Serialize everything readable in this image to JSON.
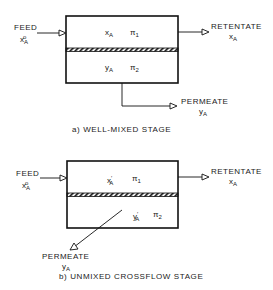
{
  "diagram_a": {
    "feed_label": "FEED",
    "feed_var": "x",
    "feed_sub": "A",
    "feed_sup": "o",
    "retentate_label": "RETENTATE",
    "retentate_var": "x",
    "retentate_sub": "A",
    "permeate_label": "PERMEATE",
    "permeate_var": "y",
    "permeate_sub": "A",
    "upper_var": "x",
    "upper_sub": "A",
    "upper_pressure": "π",
    "upper_pressure_sub": "1",
    "lower_var": "y",
    "lower_sub": "A",
    "lower_pressure": "π",
    "lower_pressure_sub": "2",
    "caption": "a) WELL-MIXED STAGE"
  },
  "diagram_b": {
    "feed_label": "FEED",
    "feed_var": "x",
    "feed_sub": "A",
    "feed_sup": "o",
    "retentate_label": "RETENTATE",
    "retentate_var": "x",
    "retentate_sub": "A",
    "permeate_label": "PERMEATE",
    "permeate_var": "y",
    "permeate_sub": "A",
    "upper_var": "x",
    "upper_sub": "A",
    "upper_prime": "′",
    "upper_pressure": "π",
    "upper_pressure_sub": "1",
    "lower_var": "y",
    "lower_sub": "A",
    "lower_prime": "′",
    "lower_pressure": "π",
    "lower_pressure_sub": "2",
    "caption": "b) UNMIXED CROSSFLOW STAGE"
  }
}
